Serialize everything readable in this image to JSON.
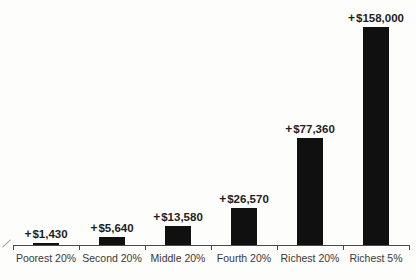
{
  "chart_data": {
    "type": "bar",
    "title": "",
    "xlabel": "",
    "ylabel": "",
    "categories": [
      "Poorest 20%",
      "Second 20%",
      "Middle 20%",
      "Fourth 20%",
      "Richest 20%",
      "Richest 5%"
    ],
    "values": [
      1430,
      5640,
      13580,
      26570,
      77360,
      158000
    ],
    "plus_sign": "+",
    "amounts": [
      "$1,430",
      "$5,640",
      "$13,580",
      "$26,570",
      "$77,360",
      "$158,000"
    ],
    "value_labels": [
      "+$1,430",
      "+$5,640",
      "+$13,580",
      "+$26,570",
      "+$77,360",
      "+$158,000"
    ],
    "ylim": [
      0,
      158000
    ],
    "grid": false,
    "legend_position": "none",
    "bar_color": "#101010",
    "axis_color": "#4a4a4a",
    "value_label_color": "#1e1e1e",
    "category_label_color": "#383838",
    "background_color": "#fdfdfb"
  }
}
